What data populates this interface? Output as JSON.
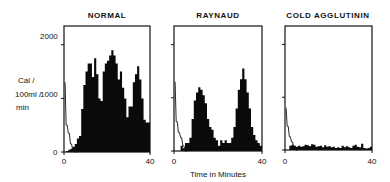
{
  "figure": {
    "y_axis_label_lines": [
      "Cal /",
      "100ml /",
      "min"
    ],
    "x_axis_label": "Time in Minutes",
    "y_ticks": [
      "0",
      "1000",
      "2000"
    ],
    "x_ticks": [
      "0",
      "40"
    ]
  },
  "chart_data": [
    {
      "type": "bar",
      "title": "NORMAL",
      "xlabel": "",
      "ylabel": "Cal / 100ml / min",
      "xlim": [
        0,
        40
      ],
      "ylim": [
        0,
        2350
      ],
      "yticks": [
        0,
        1000,
        2000
      ],
      "xticks": [
        0,
        40
      ],
      "grid": false,
      "bin_width_min": 1,
      "x": [
        0,
        1,
        2,
        3,
        4,
        5,
        6,
        7,
        8,
        9,
        10,
        11,
        12,
        13,
        14,
        15,
        16,
        17,
        18,
        19,
        20,
        21,
        22,
        23,
        24,
        25,
        26,
        27,
        28,
        29,
        30,
        31,
        32,
        33,
        34,
        35,
        36,
        37,
        38,
        39
      ],
      "series": [
        {
          "name": "heat flow (filled)",
          "values": [
            0,
            20,
            40,
            60,
            100,
            150,
            250,
            300,
            800,
            1250,
            1500,
            1650,
            1650,
            1400,
            1750,
            1450,
            1000,
            950,
            1500,
            1650,
            1700,
            1800,
            1900,
            1800,
            1650,
            1350,
            1500,
            1200,
            1000,
            650,
            850,
            850,
            1300,
            1450,
            1600,
            1350,
            1000,
            600,
            550,
            550
          ]
        },
        {
          "name": "initial curve (open line)",
          "values": [
            1300,
            500,
            350,
            150,
            50,
            0,
            0,
            0,
            0,
            0,
            0,
            0,
            0,
            0,
            0,
            0,
            0,
            0,
            0,
            0,
            0,
            0,
            0,
            0,
            0,
            0,
            0,
            0,
            0,
            0,
            0,
            0,
            0,
            0,
            0,
            0,
            0,
            0,
            0,
            0
          ]
        }
      ]
    },
    {
      "type": "bar",
      "title": "RAYNAUD",
      "xlabel": "Time in Minutes",
      "ylabel": "",
      "xlim": [
        0,
        40
      ],
      "ylim": [
        0,
        2350
      ],
      "yticks": [
        0,
        1000,
        2000
      ],
      "xticks": [
        0,
        40
      ],
      "grid": false,
      "bin_width_min": 1,
      "x": [
        0,
        1,
        2,
        3,
        4,
        5,
        6,
        7,
        8,
        9,
        10,
        11,
        12,
        13,
        14,
        15,
        16,
        17,
        18,
        19,
        20,
        21,
        22,
        23,
        24,
        25,
        26,
        27,
        28,
        29,
        30,
        31,
        32,
        33,
        34,
        35,
        36,
        37,
        38,
        39
      ],
      "series": [
        {
          "name": "heat flow (filled)",
          "values": [
            0,
            0,
            0,
            100,
            50,
            150,
            150,
            250,
            600,
            950,
            1100,
            1200,
            1150,
            1050,
            900,
            600,
            450,
            400,
            250,
            200,
            100,
            200,
            150,
            200,
            150,
            150,
            250,
            450,
            800,
            1150,
            1350,
            1550,
            1350,
            1100,
            800,
            450,
            300,
            200,
            150,
            100
          ]
        },
        {
          "name": "initial curve (open line)",
          "values": [
            1300,
            550,
            350,
            250,
            100,
            0,
            0,
            0,
            0,
            0,
            0,
            0,
            0,
            0,
            0,
            0,
            0,
            0,
            0,
            0,
            0,
            0,
            0,
            0,
            0,
            0,
            0,
            0,
            0,
            0,
            0,
            0,
            0,
            0,
            0,
            0,
            0,
            0,
            0,
            0
          ]
        }
      ]
    },
    {
      "type": "bar",
      "title": "COLD AGGLUTININ",
      "xlabel": "",
      "ylabel": "",
      "xlim": [
        0,
        40
      ],
      "ylim": [
        0,
        2350
      ],
      "yticks": [
        0,
        1000,
        2000
      ],
      "xticks": [
        0,
        40
      ],
      "grid": false,
      "bin_width_min": 1,
      "x": [
        0,
        1,
        2,
        3,
        4,
        5,
        6,
        7,
        8,
        9,
        10,
        11,
        12,
        13,
        14,
        15,
        16,
        17,
        18,
        19,
        20,
        21,
        22,
        23,
        24,
        25,
        26,
        27,
        28,
        29,
        30,
        31,
        32,
        33,
        34,
        35,
        36,
        37,
        38,
        39
      ],
      "series": [
        {
          "name": "heat flow (filled)",
          "values": [
            0,
            0,
            80,
            100,
            80,
            60,
            80,
            60,
            70,
            100,
            90,
            70,
            110,
            100,
            60,
            70,
            80,
            50,
            90,
            60,
            70,
            50,
            60,
            40,
            50,
            40,
            80,
            50,
            70,
            50,
            40,
            80,
            100,
            60,
            50,
            120,
            40,
            30,
            40,
            60
          ]
        },
        {
          "name": "initial curve (open line)",
          "values": [
            800,
            450,
            250,
            150,
            60,
            0,
            0,
            0,
            0,
            0,
            0,
            0,
            0,
            0,
            0,
            0,
            0,
            0,
            0,
            0,
            0,
            0,
            0,
            0,
            0,
            0,
            0,
            0,
            0,
            0,
            0,
            0,
            0,
            0,
            0,
            0,
            0,
            0,
            0,
            0
          ]
        }
      ]
    }
  ]
}
